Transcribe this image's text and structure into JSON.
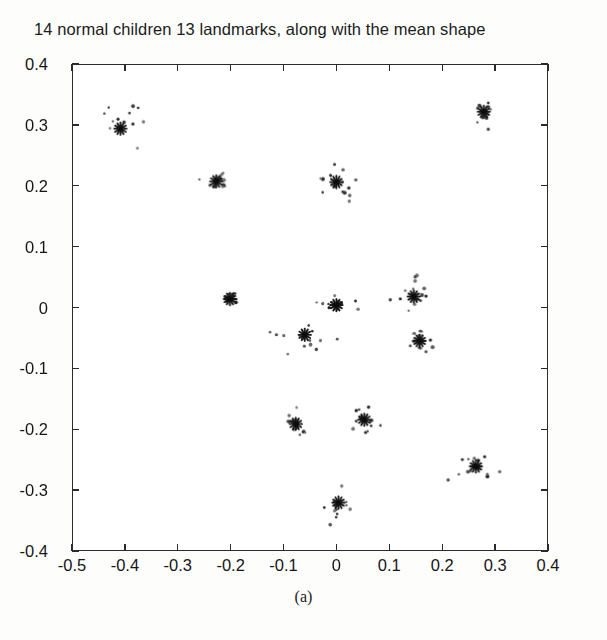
{
  "figure": {
    "title": "14 normal children 13 landmarks, along with the mean shape",
    "caption": "(a)"
  },
  "chart_data": {
    "type": "scatter",
    "title": "14 normal children 13 landmarks, along with the mean shape",
    "xlabel": "",
    "ylabel": "",
    "xlim": [
      -0.5,
      0.4
    ],
    "ylim": [
      -0.4,
      0.4
    ],
    "xticks": [
      -0.5,
      -0.4,
      -0.3,
      -0.2,
      -0.1,
      0,
      0.1,
      0.2,
      0.3,
      0.4
    ],
    "xticklabels": [
      "-0.5",
      "-0.4",
      "-0.3",
      "-0.2",
      "-0.1",
      "0",
      "0.1",
      "0.2",
      "0.3",
      "0.4"
    ],
    "yticks": [
      -0.4,
      -0.3,
      -0.2,
      -0.1,
      0,
      0.1,
      0.2,
      0.3,
      0.4
    ],
    "yticklabels": [
      "-0.4",
      "-0.3",
      "-0.2",
      "-0.1",
      "0",
      "0.1",
      "0.2",
      "0.3",
      "0.4"
    ],
    "grid": false,
    "legend": null,
    "n_subjects": 14,
    "n_landmarks": 13,
    "series": [
      {
        "name": "mean shape",
        "marker": "asterisk",
        "color": "#111111",
        "points": [
          {
            "landmark": 1,
            "x": -0.41,
            "y": 0.295
          },
          {
            "landmark": 2,
            "x": -0.228,
            "y": 0.208
          },
          {
            "landmark": 3,
            "x": 0.0,
            "y": 0.207
          },
          {
            "landmark": 4,
            "x": 0.28,
            "y": 0.323
          },
          {
            "landmark": 5,
            "x": -0.202,
            "y": 0.014
          },
          {
            "landmark": 6,
            "x": 0.0,
            "y": 0.004
          },
          {
            "landmark": 7,
            "x": 0.147,
            "y": 0.018
          },
          {
            "landmark": 8,
            "x": 0.158,
            "y": -0.055
          },
          {
            "landmark": 9,
            "x": -0.06,
            "y": -0.045
          },
          {
            "landmark": 10,
            "x": -0.077,
            "y": -0.192
          },
          {
            "landmark": 11,
            "x": 0.053,
            "y": -0.185
          },
          {
            "landmark": 12,
            "x": 0.265,
            "y": -0.262
          },
          {
            "landmark": 13,
            "x": 0.004,
            "y": -0.322
          }
        ]
      },
      {
        "name": "individual children landmarks",
        "marker": "dot",
        "color": "#3a3a3a",
        "clusters": [
          {
            "landmark": 1,
            "cx": -0.41,
            "cy": 0.295,
            "spread_x": 0.026,
            "spread_y": 0.022,
            "n": 14
          },
          {
            "landmark": 2,
            "cx": -0.228,
            "cy": 0.208,
            "spread_x": 0.011,
            "spread_y": 0.007,
            "n": 14
          },
          {
            "landmark": 3,
            "cx": 0.0,
            "cy": 0.207,
            "spread_x": 0.028,
            "spread_y": 0.018,
            "n": 14
          },
          {
            "landmark": 4,
            "cx": 0.28,
            "cy": 0.323,
            "spread_x": 0.009,
            "spread_y": 0.008,
            "n": 14
          },
          {
            "landmark": 5,
            "cx": -0.202,
            "cy": 0.014,
            "spread_x": 0.007,
            "spread_y": 0.005,
            "n": 14
          },
          {
            "landmark": 6,
            "cx": 0.0,
            "cy": 0.004,
            "spread_x": 0.014,
            "spread_y": 0.005,
            "n": 14
          },
          {
            "landmark": 7,
            "cx": 0.147,
            "cy": 0.018,
            "spread_x": 0.021,
            "spread_y": 0.017,
            "n": 14
          },
          {
            "landmark": 8,
            "cx": 0.158,
            "cy": -0.055,
            "spread_x": 0.015,
            "spread_y": 0.013,
            "n": 14
          },
          {
            "landmark": 9,
            "cx": -0.06,
            "cy": -0.045,
            "spread_x": 0.024,
            "spread_y": 0.017,
            "n": 14
          },
          {
            "landmark": 10,
            "cx": -0.077,
            "cy": -0.192,
            "spread_x": 0.013,
            "spread_y": 0.014,
            "n": 14
          },
          {
            "landmark": 11,
            "cx": 0.053,
            "cy": -0.185,
            "spread_x": 0.012,
            "spread_y": 0.014,
            "n": 14
          },
          {
            "landmark": 12,
            "cx": 0.265,
            "cy": -0.262,
            "spread_x": 0.018,
            "spread_y": 0.016,
            "n": 14
          },
          {
            "landmark": 13,
            "cx": 0.004,
            "cy": -0.322,
            "spread_x": 0.017,
            "spread_y": 0.016,
            "n": 14
          }
        ]
      }
    ]
  }
}
